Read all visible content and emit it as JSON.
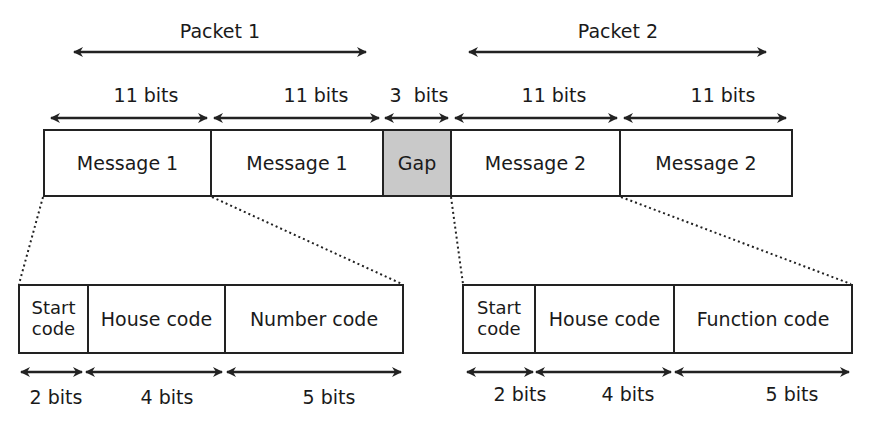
{
  "colors": {
    "stroke": "#222222",
    "gap_fill": "#c9c9c9",
    "background": "#ffffff"
  },
  "packets": [
    {
      "label": "Packet 1"
    },
    {
      "label": "Packet 2"
    }
  ],
  "top_row": {
    "widths": [
      "11 bits",
      "11 bits",
      "3  bits",
      "11 bits",
      "11 bits"
    ],
    "segments": [
      {
        "label": "Message 1"
      },
      {
        "label": "Message 1"
      },
      {
        "label": "Gap"
      },
      {
        "label": "Message 2"
      },
      {
        "label": "Message 2"
      }
    ]
  },
  "detail_left": {
    "segments": [
      {
        "line1": "Start",
        "line2": "code"
      },
      {
        "label": "House code"
      },
      {
        "label": "Number code"
      }
    ],
    "widths": [
      "2 bits",
      "4 bits",
      "5 bits"
    ]
  },
  "detail_right": {
    "segments": [
      {
        "line1": "Start",
        "line2": "code"
      },
      {
        "label": "House code"
      },
      {
        "label": "Function code"
      }
    ],
    "widths": [
      "2 bits",
      "4 bits",
      "5 bits"
    ]
  }
}
